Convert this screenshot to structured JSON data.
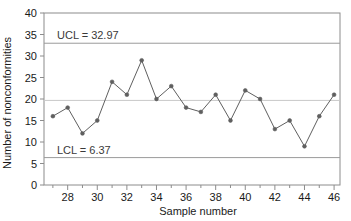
{
  "chart_data": {
    "type": "line",
    "title": "",
    "xlabel": "Sample number",
    "ylabel": "Number of nonconformities",
    "xlim": [
      26.4,
      46.4
    ],
    "ylim": [
      0,
      40
    ],
    "grid": false,
    "legend": "none",
    "x_ticks_major": [
      28,
      30,
      32,
      34,
      36,
      38,
      40,
      42,
      44,
      46
    ],
    "x_ticks_minor": [
      27,
      29,
      31,
      33,
      35,
      37,
      39,
      41,
      43,
      45
    ],
    "y_ticks": [
      0,
      5,
      10,
      15,
      20,
      25,
      30,
      35,
      40
    ],
    "series": [
      {
        "name": "Number of nonconformities",
        "color": "#5f5f5f",
        "marker": "circle",
        "x": [
          27,
          28,
          29,
          30,
          31,
          32,
          33,
          34,
          35,
          36,
          37,
          38,
          39,
          40,
          41,
          42,
          43,
          44,
          45,
          46
        ],
        "values": [
          16,
          18,
          12,
          15,
          24,
          21,
          29,
          20,
          23,
          18,
          17,
          21,
          15,
          22,
          20,
          13,
          15,
          9,
          16,
          21
        ]
      }
    ],
    "control_limits": [
      {
        "name": "UCL",
        "label": "UCL = 32.97",
        "value": 32.97,
        "color": "#9a9a9a"
      },
      {
        "name": "LCL",
        "label": "LCL = 6.37",
        "value": 6.37,
        "color": "#9a9a9a"
      },
      {
        "name": "CL",
        "label": "",
        "value": 19.67,
        "color": "#c9c9c9"
      }
    ],
    "axis_color": "#8c8c8c",
    "line_color": "#5f5f5f"
  }
}
